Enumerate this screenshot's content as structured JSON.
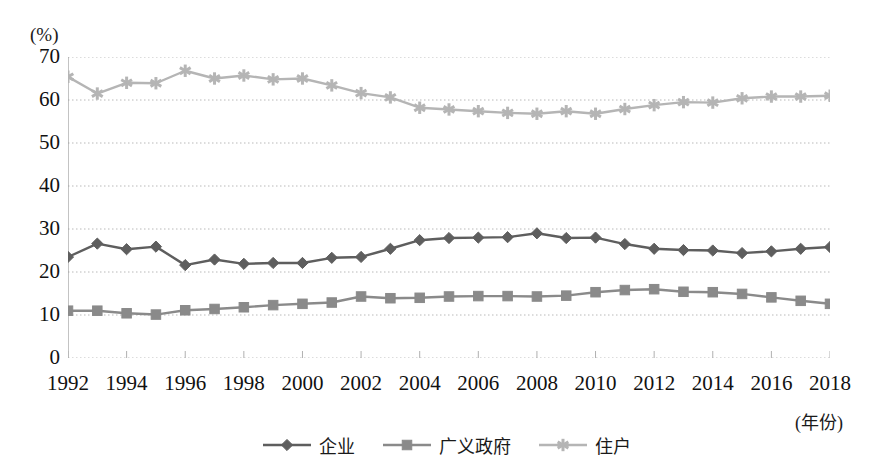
{
  "chart_data": {
    "type": "line",
    "title": "",
    "xlabel": "(年份)",
    "ylabel": "(%)",
    "ylim": [
      0,
      70
    ],
    "ytick_step": 10,
    "yticks": [
      "70",
      "60",
      "50",
      "40",
      "30",
      "20",
      "10",
      "0"
    ],
    "grid": true,
    "legend_position": "bottom-center",
    "x": [
      1992,
      1993,
      1994,
      1995,
      1996,
      1997,
      1998,
      1999,
      2000,
      2001,
      2002,
      2003,
      2004,
      2005,
      2006,
      2007,
      2008,
      2009,
      2010,
      2011,
      2012,
      2013,
      2014,
      2015,
      2016,
      2017,
      2018
    ],
    "xticks": [
      "1992",
      "1994",
      "1996",
      "1998",
      "2000",
      "2002",
      "2004",
      "2006",
      "2008",
      "2010",
      "2012",
      "2014",
      "2016",
      "2018"
    ],
    "series": [
      {
        "name": "企业",
        "marker": "diamond",
        "color": "#5e5e5e",
        "values": [
          23.5,
          26.6,
          25.3,
          25.9,
          21.6,
          22.9,
          21.9,
          22.1,
          22.1,
          23.3,
          23.5,
          25.4,
          27.4,
          27.9,
          28.0,
          28.1,
          29.0,
          27.9,
          28.0,
          26.5,
          25.4,
          25.1,
          25.0,
          24.4,
          24.8,
          25.4,
          25.8
        ]
      },
      {
        "name": "广义政府",
        "marker": "square",
        "color": "#8a8a8a",
        "values": [
          11.0,
          11.0,
          10.4,
          10.1,
          11.1,
          11.4,
          11.8,
          12.3,
          12.6,
          12.9,
          14.3,
          13.9,
          14.0,
          14.3,
          14.4,
          14.4,
          14.3,
          14.5,
          15.3,
          15.8,
          16.0,
          15.4,
          15.3,
          14.9,
          14.1,
          13.3,
          12.6
        ]
      },
      {
        "name": "住户",
        "marker": "asterisk",
        "color": "#b5b5b5",
        "values": [
          65.4,
          61.5,
          64.0,
          63.9,
          66.8,
          65.0,
          65.7,
          64.8,
          65.0,
          63.4,
          61.6,
          60.6,
          58.2,
          57.8,
          57.4,
          57.0,
          56.8,
          57.4,
          56.8,
          57.9,
          58.8,
          59.5,
          59.4,
          60.4,
          60.8,
          60.8,
          61.0
        ]
      }
    ]
  },
  "axis": {
    "unit_label": "(%)",
    "x_title": "(年份)"
  },
  "legend": {
    "items": [
      {
        "label": "企业"
      },
      {
        "label": "广义政府"
      },
      {
        "label": "住户"
      }
    ]
  }
}
